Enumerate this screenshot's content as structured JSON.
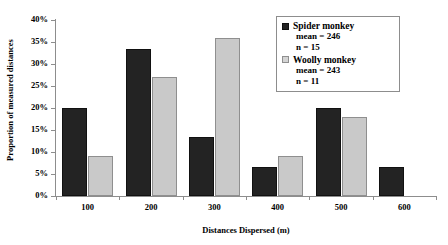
{
  "chart_data": {
    "type": "bar",
    "title": "",
    "xlabel": "Distances Dispersed (m)",
    "ylabel": "Proportion of measured distances",
    "categories": [
      "100",
      "200",
      "300",
      "400",
      "500",
      "600"
    ],
    "ylim": [
      0,
      40
    ],
    "ytick_labels": [
      "0%",
      "5%",
      "10%",
      "15%",
      "20%",
      "25%",
      "30%",
      "35%",
      "40%"
    ],
    "ytick_values": [
      0,
      5,
      10,
      15,
      20,
      25,
      30,
      35,
      40
    ],
    "grid": false,
    "legend_position": "top-right",
    "series": [
      {
        "name": "Spider monkey",
        "mean_label": "mean = 246",
        "n_label": "n = 15",
        "color": "#232323",
        "values": [
          20,
          33.3,
          13.3,
          6.7,
          20,
          6.7
        ]
      },
      {
        "name": "Woolly monkey",
        "mean_label": "mean = 243",
        "n_label": "n = 11",
        "color": "#c9c9c9",
        "values": [
          9,
          27,
          36,
          9,
          18,
          0
        ]
      }
    ]
  },
  "legend": {
    "entries": [
      {
        "swatch": "dark-square-icon",
        "title": "Spider monkey",
        "mean": "mean = 246",
        "n": "n = 15"
      },
      {
        "swatch": "light-square-icon",
        "title": "Woolly monkey",
        "mean": "mean = 243",
        "n": "n = 11"
      }
    ]
  }
}
